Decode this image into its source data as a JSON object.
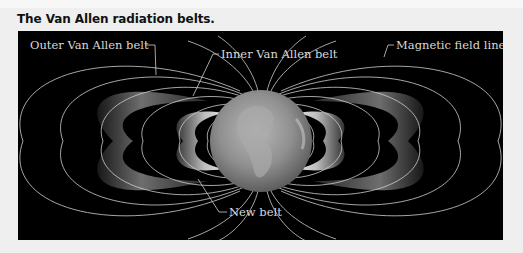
{
  "figure": {
    "title": "The Van Allen radiation belts.",
    "panel_background": "#000000",
    "page_background": "#efefef",
    "labels": {
      "outer_belt": "Outer Van Allen belt",
      "inner_belt": "Inner Van Allen belt",
      "field_lines": "Magnetic field lines",
      "new_belt": "New belt"
    },
    "elements": [
      "Earth globe",
      "Outer Van Allen belt (left/right)",
      "Inner Van Allen belt (left/right)",
      "New belt",
      "Magnetic field lines"
    ]
  }
}
